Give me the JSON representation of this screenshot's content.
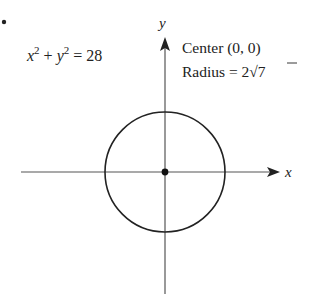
{
  "diagram": {
    "bullet": "•",
    "equation": {
      "lhs_var1": "x",
      "exp1": "2",
      "plus": " + ",
      "lhs_var2": "y",
      "exp2": "2",
      "rhs": " = 28"
    },
    "annotation": {
      "center_label": "Center (0, 0)",
      "radius_prefix": "Radius = 2",
      "radius_root": "7"
    },
    "axes": {
      "x_label": "x",
      "y_label": "y"
    },
    "circle": {
      "center": [
        0,
        0
      ],
      "radius": "2√7",
      "equation": "x^2 + y^2 = 28"
    },
    "colors": {
      "stroke": "#222222",
      "axis": "#555555"
    }
  }
}
